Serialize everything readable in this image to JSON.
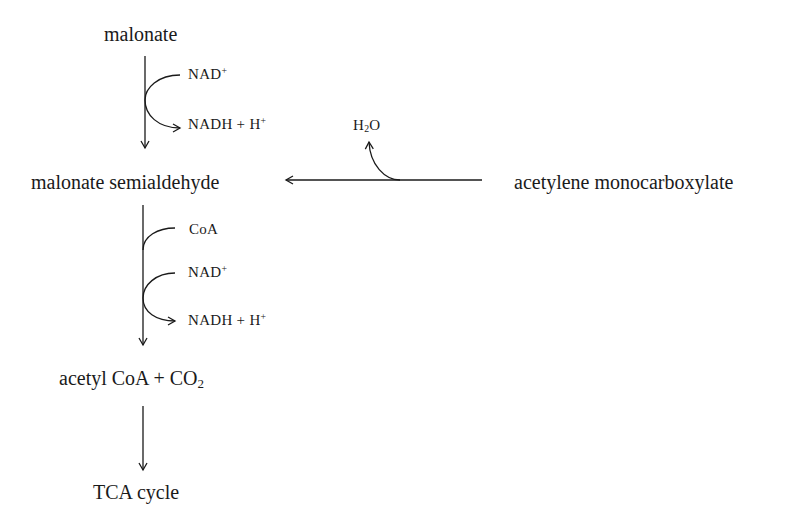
{
  "diagram": {
    "type": "metabolic-pathway",
    "nodes": {
      "malonate": "malonate",
      "malonate_semialdehyde": "malonate semialdehyde",
      "acetylene_monocarboxylate": "acetylene monocarboxylate",
      "acetyl_coa_co2": {
        "main": "acetyl CoA + CO",
        "sub": "2"
      },
      "tca_cycle": "TCA cycle"
    },
    "step1": {
      "from": "malonate",
      "to": "malonate semialdehyde",
      "cofactor_in": {
        "main": "NAD",
        "sup": "+"
      },
      "cofactor_out": {
        "main": "NADH + H",
        "sup": "+"
      }
    },
    "step_side": {
      "from": "acetylene monocarboxylate",
      "to": "malonate semialdehyde",
      "product": {
        "pre": "H",
        "sub": "2",
        "post": "O"
      }
    },
    "step2": {
      "from": "malonate semialdehyde",
      "to": "acetyl CoA + CO2",
      "cofactor_in_1": "CoA",
      "cofactor_in_2": {
        "main": "NAD",
        "sup": "+"
      },
      "cofactor_out": {
        "main": "NADH + H",
        "sup": "+"
      }
    },
    "step3": {
      "from": "acetyl CoA + CO2",
      "to": "TCA cycle"
    },
    "colors": {
      "ink": "#1a1a1a",
      "background": "#ffffff"
    }
  }
}
